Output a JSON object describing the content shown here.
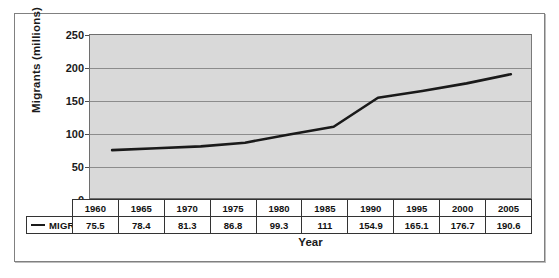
{
  "chart_data": {
    "type": "line",
    "title": "",
    "xlabel": "Year",
    "ylabel": "Migrants  (millions)",
    "categories": [
      "1960",
      "1965",
      "1970",
      "1975",
      "1980",
      "1985",
      "1990",
      "1995",
      "2000",
      "2005"
    ],
    "series": [
      {
        "name": "MIGRANTS",
        "values": [
          75.5,
          78.4,
          81.3,
          86.8,
          99.3,
          111,
          154.9,
          165.1,
          176.7,
          190.6
        ],
        "labels": [
          "75.5",
          "78.4",
          "81.3",
          "86.8",
          "99.3",
          "111",
          "154.9",
          "165.1",
          "176.7",
          "190.6"
        ],
        "color": "#1a1a1a"
      }
    ],
    "ylim": [
      0,
      250
    ],
    "yticks": [
      0,
      50,
      100,
      150,
      200,
      250
    ],
    "ytick_labels": [
      "0",
      "50",
      "100",
      "150",
      "200",
      "250"
    ],
    "grid": true,
    "legend_position": "table-row-header",
    "plot_background": "#d9d9d9",
    "gridline_color": "#8c8c8c",
    "frame_border_color": "#808080"
  },
  "table": {
    "legend_label": "MIGRANTS",
    "year_header": [
      "1960",
      "1965",
      "1970",
      "1975",
      "1980",
      "1985",
      "1990",
      "1995",
      "2000",
      "2005"
    ],
    "value_row": [
      "75.5",
      "78.4",
      "81.3",
      "86.8",
      "99.3",
      "111",
      "154.9",
      "165.1",
      "176.7",
      "190.6"
    ]
  },
  "axis": {
    "y_title": "Migrants  (millions)",
    "x_title": "Year",
    "y_ticks": [
      "250",
      "200",
      "150",
      "100",
      "50",
      "0"
    ]
  }
}
